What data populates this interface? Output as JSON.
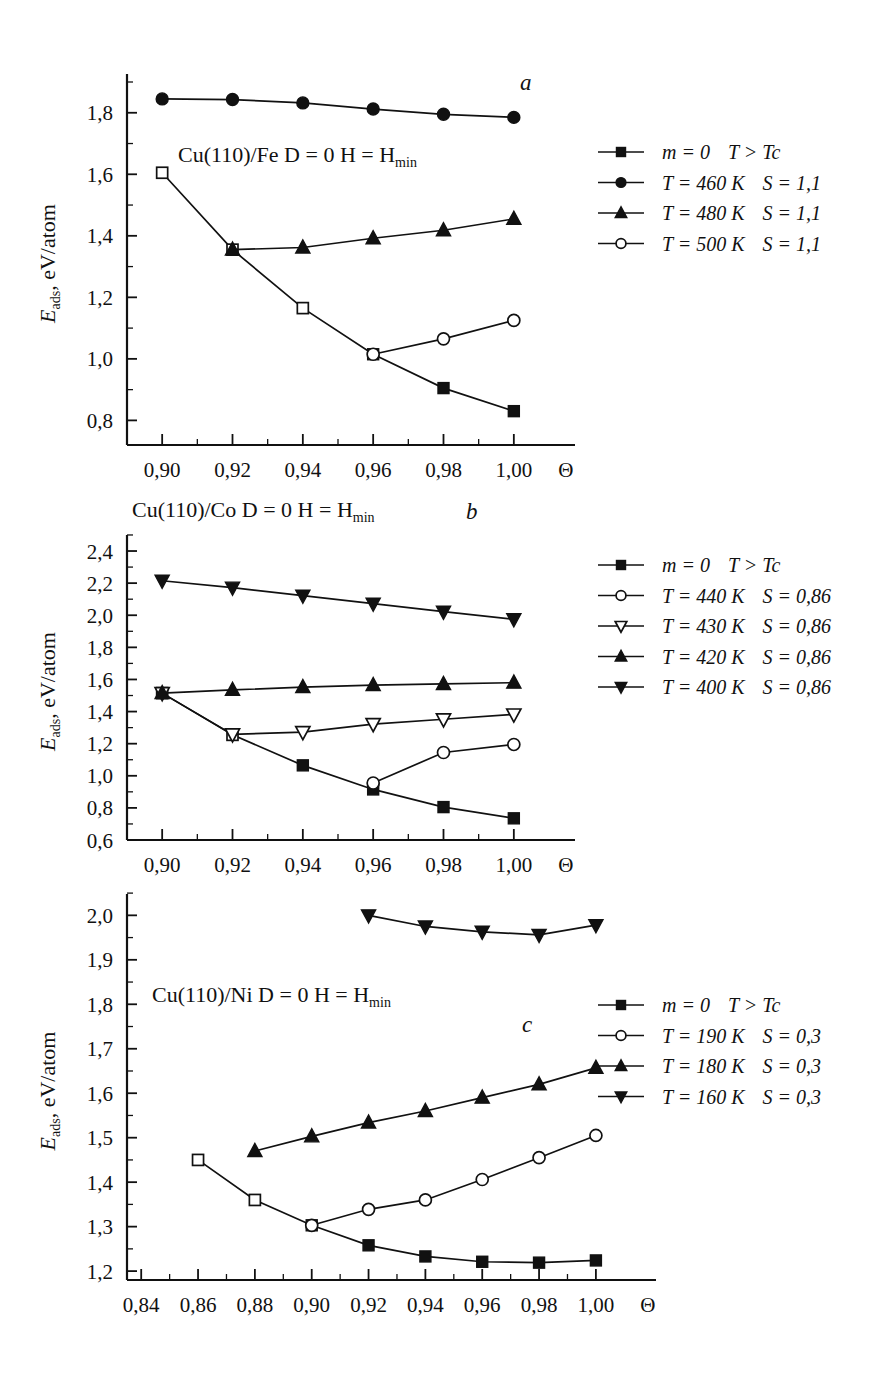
{
  "figure": {
    "axis_y_label_main": "E",
    "axis_y_label_sub": "ads",
    "axis_y_label_rest": ", eV/atom",
    "axis_x_symbol": "Θ"
  },
  "chart_data": [
    {
      "id": "a",
      "type": "line",
      "panel_letter": "a",
      "title": "",
      "annotation": "Cu(110)/Fe  D = 0  H = H",
      "annotation_sub": "min",
      "xlabel": "Θ",
      "ylabel": "E_ads, eV/atom",
      "xlim": [
        0.89,
        1.01
      ],
      "ylim": [
        0.72,
        1.9
      ],
      "xticks": [
        0.9,
        0.92,
        0.94,
        0.96,
        0.98,
        1.0
      ],
      "xtick_labels": [
        "0,90",
        "0,92",
        "0,94",
        "0,96",
        "0,98",
        "1,00"
      ],
      "yticks": [
        0.8,
        1.0,
        1.2,
        1.4,
        1.6,
        1.8
      ],
      "ytick_labels": [
        "0,8",
        "1,0",
        "1,2",
        "1,4",
        "1,6",
        "1,8"
      ],
      "grid": false,
      "legend_position": "right",
      "series": [
        {
          "name": "m = 0    T > Tc",
          "marker": "square-filled",
          "x": [
            0.9,
            0.92,
            0.94,
            0.96,
            0.98,
            1.0
          ],
          "values": [
            1.605,
            1.355,
            1.165,
            1.015,
            0.905,
            0.83
          ],
          "open_until_index": 3
        },
        {
          "name": "T = 460 K   S = 1,1",
          "marker": "circle-filled",
          "x": [
            0.9,
            0.92,
            0.94,
            0.96,
            0.98,
            1.0
          ],
          "values": [
            1.845,
            1.843,
            1.832,
            1.812,
            1.795,
            1.785
          ]
        },
        {
          "name": "T = 480 K   S = 1,1",
          "marker": "triangle-up-filled",
          "x": [
            0.92,
            0.94,
            0.96,
            0.98,
            1.0
          ],
          "values": [
            1.355,
            1.362,
            1.392,
            1.418,
            1.455
          ]
        },
        {
          "name": "T = 500 K   S = 1,1",
          "marker": "circle-open",
          "x": [
            0.96,
            0.98,
            1.0
          ],
          "values": [
            1.015,
            1.065,
            1.125
          ]
        }
      ],
      "legend": [
        {
          "marker": "square-filled",
          "label_main": "m = 0",
          "label_rest": "T > Tc"
        },
        {
          "marker": "circle-filled",
          "label_main": "T = 460 K",
          "label_rest": "S = 1,1"
        },
        {
          "marker": "triangle-up-filled",
          "label_main": "T = 480 K",
          "label_rest": "S = 1,1"
        },
        {
          "marker": "circle-open",
          "label_main": "T = 500 K",
          "label_rest": "S = 1,1"
        }
      ]
    },
    {
      "id": "b",
      "type": "line",
      "panel_letter": "b",
      "annotation": "Cu(110)/Co  D = 0  H = H",
      "annotation_sub": "min",
      "xlabel": "Θ",
      "ylabel": "E_ads, eV/atom",
      "xlim": [
        0.89,
        1.01
      ],
      "ylim": [
        0.6,
        2.45
      ],
      "xticks": [
        0.9,
        0.92,
        0.94,
        0.96,
        0.98,
        1.0
      ],
      "xtick_labels": [
        "0,90",
        "0,92",
        "0,94",
        "0,96",
        "0,98",
        "1,00"
      ],
      "yticks": [
        0.6,
        0.8,
        1.0,
        1.2,
        1.4,
        1.6,
        1.8,
        2.0,
        2.2,
        2.4
      ],
      "ytick_labels": [
        "0,6",
        "0,8",
        "1,0",
        "1,2",
        "1,4",
        "1,6",
        "1,8",
        "2,0",
        "2,2",
        "2,4"
      ],
      "grid": false,
      "legend_position": "right",
      "series": [
        {
          "name": "m = 0    T > Tc",
          "marker": "square-filled",
          "x": [
            0.9,
            0.92,
            0.94,
            0.96,
            0.98,
            1.0
          ],
          "values": [
            1.515,
            1.255,
            1.065,
            0.915,
            0.805,
            0.735
          ],
          "open_until_index": 2
        },
        {
          "name": "T = 440 K   S = 0,86",
          "marker": "circle-open",
          "x": [
            0.96,
            0.98,
            1.0
          ],
          "values": [
            0.955,
            1.145,
            1.195
          ]
        },
        {
          "name": "T = 430 K   S = 0,86",
          "marker": "triangle-down-open",
          "x": [
            0.9,
            0.92,
            0.94,
            0.96,
            0.98,
            1.0
          ],
          "values": [
            1.515,
            1.258,
            1.272,
            1.322,
            1.352,
            1.382
          ]
        },
        {
          "name": "T = 420 K   S = 0,86",
          "marker": "triangle-up-filled",
          "x": [
            0.9,
            0.92,
            0.94,
            0.96,
            0.98,
            1.0
          ],
          "values": [
            1.515,
            1.535,
            1.552,
            1.565,
            1.572,
            1.58
          ]
        },
        {
          "name": "T = 400 K   S = 0,86",
          "marker": "triangle-down-filled",
          "x": [
            0.9,
            0.92,
            0.94,
            0.96,
            0.98,
            1.0
          ],
          "values": [
            2.215,
            2.172,
            2.122,
            2.072,
            2.022,
            1.975
          ]
        }
      ],
      "legend": [
        {
          "marker": "square-filled",
          "label_main": "m = 0",
          "label_rest": "T > Tc"
        },
        {
          "marker": "circle-open",
          "label_main": "T = 440 K",
          "label_rest": "S = 0,86"
        },
        {
          "marker": "triangle-down-open",
          "label_main": "T = 430 K",
          "label_rest": "S = 0,86"
        },
        {
          "marker": "triangle-up-filled",
          "label_main": "T = 420 K",
          "label_rest": "S = 0,86"
        },
        {
          "marker": "triangle-down-filled",
          "label_main": "T = 400 K",
          "label_rest": "S = 0,86"
        }
      ]
    },
    {
      "id": "c",
      "type": "line",
      "panel_letter": "c",
      "annotation": "Cu(110)/Ni  D = 0  H = H",
      "annotation_sub": "min",
      "xlabel": "Θ",
      "ylabel": "E_ads, eV/atom",
      "xlim": [
        0.835,
        1.012
      ],
      "ylim": [
        1.18,
        2.03
      ],
      "xticks": [
        0.84,
        0.86,
        0.88,
        0.9,
        0.92,
        0.94,
        0.96,
        0.98,
        1.0
      ],
      "xtick_labels": [
        "0,84",
        "0,86",
        "0,88",
        "0,90",
        "0,92",
        "0,94",
        "0,96",
        "0,98",
        "1,00"
      ],
      "yticks": [
        1.2,
        1.3,
        1.4,
        1.5,
        1.6,
        1.7,
        1.8,
        1.9,
        2.0
      ],
      "ytick_labels": [
        "1,2",
        "1,3",
        "1,4",
        "1,5",
        "1,6",
        "1,7",
        "1,8",
        "1,9",
        "2,0"
      ],
      "grid": false,
      "legend_position": "right",
      "series": [
        {
          "name": "m = 0    T > Tc",
          "marker": "square-filled",
          "x": [
            0.86,
            0.88,
            0.9,
            0.92,
            0.94,
            0.96,
            0.98,
            1.0
          ],
          "values": [
            1.45,
            1.36,
            1.303,
            1.258,
            1.233,
            1.221,
            1.219,
            1.224
          ],
          "open_until_index": 2
        },
        {
          "name": "T = 190 K   S = 0,3",
          "marker": "circle-open",
          "x": [
            0.9,
            0.92,
            0.94,
            0.96,
            0.98,
            1.0
          ],
          "values": [
            1.303,
            1.339,
            1.36,
            1.406,
            1.455,
            1.505
          ]
        },
        {
          "name": "T = 180 K   S = 0,3",
          "marker": "triangle-up-filled",
          "x": [
            0.88,
            0.9,
            0.92,
            0.94,
            0.96,
            0.98,
            1.0
          ],
          "values": [
            1.47,
            1.503,
            1.534,
            1.56,
            1.59,
            1.62,
            1.657
          ]
        },
        {
          "name": "T = 160 K   S = 0,3",
          "marker": "triangle-down-filled",
          "x": [
            0.92,
            0.94,
            0.96,
            0.98,
            1.0
          ],
          "values": [
            2.0,
            1.975,
            1.963,
            1.956,
            1.978
          ]
        }
      ],
      "legend": [
        {
          "marker": "square-filled",
          "label_main": "m = 0",
          "label_rest": "T > Tc"
        },
        {
          "marker": "circle-open",
          "label_main": "T = 190 K",
          "label_rest": "S = 0,3"
        },
        {
          "marker": "triangle-up-filled",
          "label_main": "T = 180 K",
          "label_rest": "S = 0,3"
        },
        {
          "marker": "triangle-down-filled",
          "label_main": "T = 160 K",
          "label_rest": "S = 0,3"
        }
      ]
    }
  ]
}
